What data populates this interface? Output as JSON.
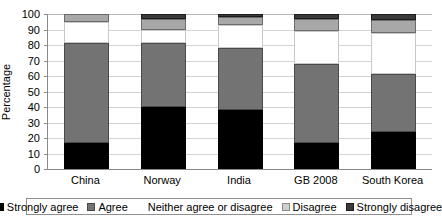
{
  "chart_data": {
    "type": "bar",
    "subtype": "stacked-bar-100",
    "title": "",
    "xlabel": "",
    "ylabel": "Percentage",
    "ylim": [
      0,
      100
    ],
    "yticks": [
      0,
      10,
      20,
      30,
      40,
      50,
      60,
      70,
      80,
      90,
      100
    ],
    "ytick_labels": [
      "0",
      "10",
      "20",
      "30",
      "40",
      "50",
      "60",
      "70",
      "80",
      "90",
      "100"
    ],
    "grid": true,
    "legend_position": "bottom",
    "categories": [
      "China",
      "Norway",
      "India",
      "GB 2008",
      "South Korea"
    ],
    "series": [
      {
        "name": "Strongly agree",
        "color": "#000000",
        "values": [
          17,
          40,
          38,
          17,
          24
        ]
      },
      {
        "name": "Agree",
        "color": "#737373",
        "values": [
          64,
          41,
          40,
          51,
          37
        ]
      },
      {
        "name": "Neither agree or disagree",
        "color": "#ffffff",
        "values": [
          14,
          9,
          15,
          21,
          27
        ]
      },
      {
        "name": "Disagree",
        "color": "#a8a8a8",
        "values": [
          5,
          7,
          5,
          8,
          8
        ]
      },
      {
        "name": "Strongly disagree",
        "color": "#3a3a3a",
        "values": [
          0,
          3,
          2,
          3,
          4
        ]
      }
    ]
  },
  "legend": {
    "items": [
      {
        "label": "Strongly agree",
        "key": "strongly-agree"
      },
      {
        "label": "Agree",
        "key": "agree"
      },
      {
        "label": "Neither agree or disagree",
        "key": "neither"
      },
      {
        "label": "Disagree",
        "key": "disagree"
      },
      {
        "label": "Strongly disagree",
        "key": "strongly-disagree"
      }
    ]
  }
}
